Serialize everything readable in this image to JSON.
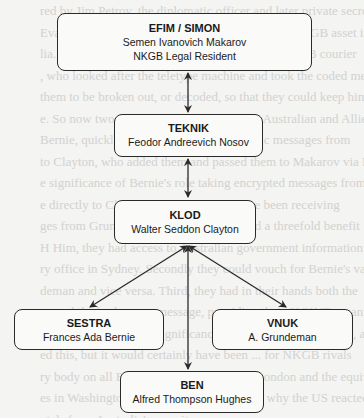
{
  "background_text": [
    "red by Jim Petrov, the diplomatic officer and later private secretary",
    "Evatt, the Foreign Minister. He became the first NKGB asset in",
    "lia. Already working at the time was the Mini NKGB courier",
    ", who looked after the teletype machine and took the coded messages",
    "them to be broken out, or decoded, so that they could keep him",
    "e. So now two NKGB assets had access to Australian and Allied secrets.",
    "Bernie, quickly admitted that the diplomatic messages from",
    "to Clayton, who added them and passed them to Makarov via Nosov.",
    "e significance of Bernie's role taking encrypted messages from",
    "e directly to Clayton is that he would have been receiving",
    "ges from Grundeman as well. He provided a threefold benefit",
    "H Him, they had access to Australian government information being",
    "ry office in Sydney. Secondly they could vouch for Bernie's value",
    "deman and vice versa. Third, they had in their hands both the",
    "ge and the broken-out message, providing their SIGINT organisation",
    "sets of pure gold. The significance of this ... was remarkable, and",
    "ed this, but it would certainly have been ... for NKGB rivals",
    "ry body on all British SIGINT sources in London and the equivalent",
    "es in Washington and it was this the reason why the US reacted",
    "ntals from Australia's security ...",
    "was the ... pattern of Australian ... of communications"
  ],
  "diagram": {
    "nodes": [
      {
        "id": "efim",
        "codename": "EFIM / SIMON",
        "lines": [
          "Semen Ivanovich Makarov",
          "NKGB Legal Resident"
        ]
      },
      {
        "id": "teknik",
        "codename": "TEKNIK",
        "lines": [
          "Feodor Andreevich Nosov"
        ]
      },
      {
        "id": "klod",
        "codename": "KLOD",
        "lines": [
          "Walter Seddon Clayton"
        ]
      },
      {
        "id": "sestra",
        "codename": "SESTRA",
        "lines": [
          "Frances Ada Bernie"
        ]
      },
      {
        "id": "vnuk",
        "codename": "VNUK",
        "lines": [
          "A. Grundeman"
        ]
      },
      {
        "id": "ben",
        "codename": "BEN",
        "lines": [
          "Alfred Thompson Hughes"
        ]
      }
    ],
    "edges": [
      {
        "from": "efim",
        "to": "teknik",
        "type": "bidirectional"
      },
      {
        "from": "teknik",
        "to": "klod",
        "type": "bidirectional"
      },
      {
        "from": "klod",
        "to": "sestra",
        "type": "bidirectional"
      },
      {
        "from": "klod",
        "to": "vnuk",
        "type": "bidirectional"
      },
      {
        "from": "klod",
        "to": "ben",
        "type": "bidirectional"
      }
    ],
    "colors": {
      "border": "#2a2a2a",
      "arrow": "#2a2a2a",
      "node_fill": "#fafaf8",
      "page": "#f4f4f2",
      "faded_text": "#d2d2d0"
    }
  }
}
